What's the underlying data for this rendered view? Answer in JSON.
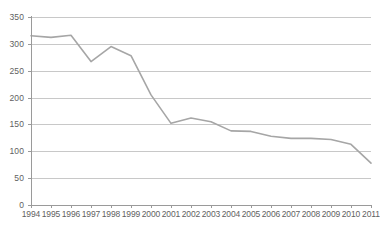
{
  "chart_data": {
    "type": "line",
    "title": "",
    "xlabel": "",
    "ylabel": "",
    "categories": [
      "1994",
      "1995",
      "1996",
      "1997",
      "1998",
      "1999",
      "2000",
      "2001",
      "2002",
      "2003",
      "2004",
      "2005",
      "2006",
      "2007",
      "2008",
      "2009",
      "2010",
      "2011"
    ],
    "values": [
      315,
      312,
      316,
      267,
      295,
      278,
      205,
      152,
      162,
      155,
      138,
      137,
      128,
      124,
      124,
      122,
      113,
      78
    ],
    "series": [
      {
        "name": "",
        "values": [
          315,
          312,
          316,
          267,
          295,
          278,
          205,
          152,
          162,
          155,
          138,
          137,
          128,
          124,
          124,
          122,
          113,
          78
        ]
      }
    ],
    "ylim": [
      0,
      350
    ],
    "yticks": [
      0,
      50,
      100,
      150,
      200,
      250,
      300,
      350
    ],
    "ytick_labels": [
      "0",
      "50",
      "100",
      "150",
      "200",
      "250",
      "300",
      "350"
    ],
    "grid": true,
    "legend": false,
    "legend_position": "none",
    "markers": false,
    "line_color": "#a6a6a6",
    "grid_color": "#c8c8c8",
    "axis_color": "#9a9a9a",
    "tick_label_color": "#5f5f5f",
    "background_color": "#ffffff"
  }
}
